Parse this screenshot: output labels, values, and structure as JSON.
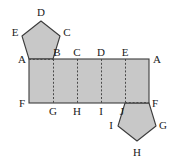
{
  "figure": {
    "background_color": "#ffffff",
    "fill_color": "#c8c8c8",
    "stroke_color": "#3c3c3c",
    "fold_line_color": "#4a4a4a",
    "label_color": "#1a1a1a"
  },
  "shapes": {
    "rectangle": {
      "name": "lateral-faces-rectangle",
      "x": 29,
      "y": 59,
      "width": 120,
      "height": 44,
      "fold_lines_x": [
        53,
        77,
        101,
        125
      ]
    },
    "top_pentagon": {
      "name": "top-base-pentagon",
      "points": "29,59 53,59 60,36 41,21 22,36"
    },
    "bottom_pentagon": {
      "name": "bottom-base-pentagon",
      "points": "125,103 149,103 156,126 137,141 118,126"
    }
  },
  "labels": [
    {
      "text": "D",
      "x": 41,
      "y": 12,
      "name": "label-D-top-pentagon"
    },
    {
      "text": "E",
      "x": 15,
      "y": 32,
      "name": "label-E-top-pentagon"
    },
    {
      "text": "C",
      "x": 67,
      "y": 32,
      "name": "label-C-top-pentagon"
    },
    {
      "text": "A",
      "x": 22,
      "y": 59,
      "name": "label-A-left"
    },
    {
      "text": "B",
      "x": 57,
      "y": 52,
      "name": "label-B-top-edge"
    },
    {
      "text": "C",
      "x": 77,
      "y": 52,
      "name": "label-C-top-edge"
    },
    {
      "text": "D",
      "x": 101,
      "y": 52,
      "name": "label-D-top-edge"
    },
    {
      "text": "E",
      "x": 125,
      "y": 52,
      "name": "label-E-top-edge"
    },
    {
      "text": "A",
      "x": 157,
      "y": 59,
      "name": "label-A-right"
    },
    {
      "text": "F",
      "x": 22,
      "y": 103,
      "name": "label-F-left"
    },
    {
      "text": "G",
      "x": 53,
      "y": 111,
      "name": "label-G-bottom-edge"
    },
    {
      "text": "H",
      "x": 77,
      "y": 111,
      "name": "label-H-bottom-edge"
    },
    {
      "text": "I",
      "x": 101,
      "y": 111,
      "name": "label-I-bottom-edge"
    },
    {
      "text": "J",
      "x": 122,
      "y": 111,
      "name": "label-J-bottom-edge"
    },
    {
      "text": "F",
      "x": 155,
      "y": 103,
      "name": "label-F-right"
    },
    {
      "text": "I",
      "x": 111,
      "y": 125,
      "name": "label-I-bottom-pentagon"
    },
    {
      "text": "G",
      "x": 163,
      "y": 125,
      "name": "label-G-bottom-pentagon"
    },
    {
      "text": "H",
      "x": 137,
      "y": 152,
      "name": "label-H-bottom-pentagon"
    }
  ]
}
